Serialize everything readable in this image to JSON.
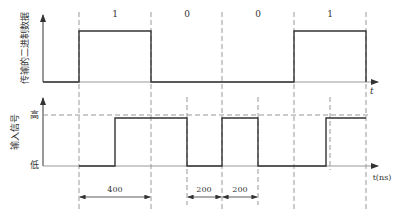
{
  "top_chart": {
    "ylabel": "传输的二进制数据",
    "xlabel": "t",
    "bits": [
      "1",
      "0",
      "0",
      "1"
    ]
  },
  "bottom_chart": {
    "ylabel": "输入信号",
    "high_label": "高",
    "low_label": "低",
    "xlabel": "t(ns)"
  },
  "dimensions": [
    "400",
    "200",
    "200"
  ],
  "colors": {
    "line": "#333333",
    "dash": "#999999"
  }
}
